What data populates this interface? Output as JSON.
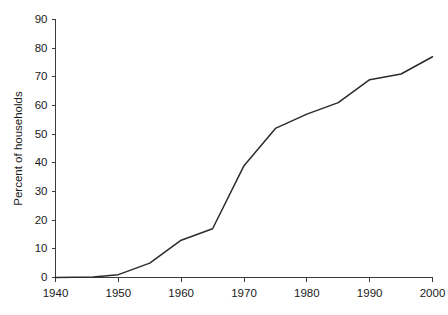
{
  "chart_data": {
    "type": "line",
    "title": "",
    "xlabel": "",
    "ylabel": "Percent of households",
    "xlim": [
      1940,
      2000
    ],
    "ylim": [
      0,
      90
    ],
    "xticks": [
      1940,
      1950,
      1960,
      1970,
      1980,
      1990,
      2000
    ],
    "yticks": [
      0,
      10,
      20,
      30,
      40,
      50,
      60,
      70,
      80,
      90
    ],
    "xtick_labels": [
      "1940",
      "1950",
      "1960",
      "1970",
      "1980",
      "1990",
      "2000"
    ],
    "ytick_labels": [
      "0",
      "10",
      "20",
      "30",
      "40",
      "50",
      "60",
      "70",
      "80",
      "90"
    ],
    "grid": false,
    "legend": false,
    "legend_position": "none",
    "line_color": "#2b2b2b",
    "axis_color": "#3a3a3a",
    "background_color": "#ffffff",
    "x": [
      1940,
      1946,
      1950,
      1955,
      1960,
      1965,
      1970,
      1975,
      1980,
      1985,
      1990,
      1995,
      2000
    ],
    "values": [
      0,
      0.2,
      1,
      5,
      13,
      17,
      39,
      52,
      57,
      61,
      69,
      71,
      77
    ],
    "series": [
      {
        "name": "Percent of households",
        "x": [
          1940,
          1946,
          1950,
          1955,
          1960,
          1965,
          1970,
          1975,
          1980,
          1985,
          1990,
          1995,
          2000
        ],
        "values": [
          0,
          0.2,
          1,
          5,
          13,
          17,
          39,
          52,
          57,
          61,
          69,
          71,
          77
        ]
      }
    ],
    "annotations": []
  },
  "axes": {
    "y_title": "Percent of households"
  }
}
